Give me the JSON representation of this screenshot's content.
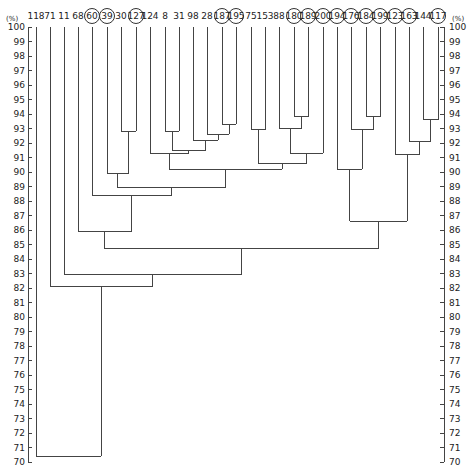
{
  "chart_data": {
    "type": "dendrogram",
    "title": "",
    "ylabel": "(%)",
    "ylim": [
      70,
      100
    ],
    "y_ticks": [
      100,
      99,
      98,
      97,
      96,
      95,
      94,
      93,
      92,
      91,
      90,
      89,
      88,
      87,
      86,
      85,
      84,
      83,
      82,
      81,
      80,
      79,
      78,
      77,
      76,
      75,
      74,
      73,
      72,
      71,
      70
    ],
    "axes": [
      "left",
      "right"
    ],
    "leaves": [
      {
        "label": "118",
        "circled": false
      },
      {
        "label": "71",
        "circled": false
      },
      {
        "label": "11",
        "circled": false
      },
      {
        "label": "68",
        "circled": false
      },
      {
        "label": "60",
        "circled": true
      },
      {
        "label": "39",
        "circled": true
      },
      {
        "label": "30",
        "circled": false
      },
      {
        "label": "127",
        "circled": true
      },
      {
        "label": "124",
        "circled": false
      },
      {
        "label": "8",
        "circled": false
      },
      {
        "label": "31",
        "circled": false
      },
      {
        "label": "98",
        "circled": false
      },
      {
        "label": "28",
        "circled": false
      },
      {
        "label": "187",
        "circled": true
      },
      {
        "label": "195",
        "circled": true
      },
      {
        "label": "75",
        "circled": false
      },
      {
        "label": "153",
        "circled": false
      },
      {
        "label": "88",
        "circled": false
      },
      {
        "label": "180",
        "circled": true
      },
      {
        "label": "189",
        "circled": true
      },
      {
        "label": "200",
        "circled": true
      },
      {
        "label": "194",
        "circled": true
      },
      {
        "label": "176",
        "circled": true
      },
      {
        "label": "184",
        "circled": true
      },
      {
        "label": "199",
        "circled": true
      },
      {
        "label": "123",
        "circled": true
      },
      {
        "label": "163",
        "circled": true
      },
      {
        "label": "144",
        "circled": false
      },
      {
        "label": "117",
        "circled": true
      }
    ],
    "merges": [
      {
        "id": "A",
        "children": [
          "30",
          "127"
        ],
        "similarity": 92.8
      },
      {
        "id": "B",
        "children": [
          "8",
          "31"
        ],
        "similarity": 92.8
      },
      {
        "id": "C",
        "children": [
          "187",
          "195"
        ],
        "similarity": 93.3
      },
      {
        "id": "D",
        "children": [
          "28",
          "C"
        ],
        "similarity": 92.6
      },
      {
        "id": "E",
        "children": [
          "98",
          "D"
        ],
        "similarity": 92.2
      },
      {
        "id": "F",
        "children": [
          "B",
          "E"
        ],
        "similarity": 91.5
      },
      {
        "id": "G",
        "children": [
          "124",
          "F"
        ],
        "similarity": 91.3
      },
      {
        "id": "H",
        "children": [
          "75",
          "153"
        ],
        "similarity": 92.9
      },
      {
        "id": "I",
        "children": [
          "180",
          "189"
        ],
        "similarity": 93.8
      },
      {
        "id": "J",
        "children": [
          "88",
          "I"
        ],
        "similarity": 93.0
      },
      {
        "id": "K",
        "children": [
          "200",
          "J"
        ],
        "similarity": 92.9
      },
      {
        "id": "L",
        "children": [
          "K",
          "194"
        ],
        "similarity": 91.3
      },
      {
        "id": "M",
        "children": [
          "H",
          "L"
        ],
        "similarity": 90.6
      },
      {
        "id": "N",
        "children": [
          "G",
          "M"
        ],
        "similarity": 90.2
      },
      {
        "id": "O",
        "children": [
          "39",
          "A"
        ],
        "similarity": 89.9
      },
      {
        "id": "P",
        "children": [
          "O",
          "N"
        ],
        "similarity": 88.9
      },
      {
        "id": "Q",
        "children": [
          "60",
          "P"
        ],
        "similarity": 88.4
      },
      {
        "id": "R",
        "children": [
          "184",
          "199"
        ],
        "similarity": 93.8
      },
      {
        "id": "S",
        "children": [
          "176",
          "R"
        ],
        "similarity": 92.8
      },
      {
        "id": "T",
        "children": [
          "194x",
          "S"
        ],
        "similarity": 90.2
      },
      {
        "id": "U",
        "children": [
          "144",
          "117"
        ],
        "similarity": 93.6
      },
      {
        "id": "V",
        "children": [
          "163",
          "U"
        ],
        "similarity": 92.1
      },
      {
        "id": "W",
        "children": [
          "123",
          "V"
        ],
        "similarity": 91.1
      },
      {
        "id": "X",
        "children": [
          "T",
          "W"
        ],
        "similarity": 86.6
      },
      {
        "id": "Y",
        "children": [
          "68",
          "Q"
        ],
        "similarity": 85.9
      },
      {
        "id": "Z",
        "children": [
          "Y",
          "X"
        ],
        "similarity": 84.7
      },
      {
        "id": "AA",
        "children": [
          "11",
          "Z"
        ],
        "similarity": 82.9
      },
      {
        "id": "AB",
        "children": [
          "71",
          "AA"
        ],
        "similarity": 82.1
      },
      {
        "id": "AC",
        "children": [
          "118",
          "AB"
        ],
        "similarity": 70.4
      }
    ]
  }
}
